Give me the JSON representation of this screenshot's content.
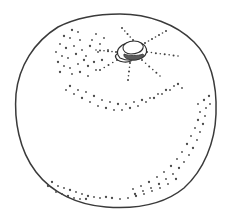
{
  "illustration": {
    "title": "Citrus fruit line drawing",
    "subject": "orange",
    "style": "pen-and-ink stipple line art",
    "canvas": {
      "width": 236,
      "height": 220
    },
    "colors": {
      "background": "#ffffff",
      "outline": "#3a3a3a",
      "stipple": "#4a4a4a",
      "calyx_outline": "#2e2e2e",
      "calyx_shade": "#5a5a5a"
    },
    "body": {
      "label": "fruit body contour",
      "shape": "irregular circle, slightly flattened at top",
      "bounds": {
        "left": 14,
        "top": 14,
        "right": 217,
        "bottom": 208
      },
      "path": "M 120 14 C 148 14 176 24 194 42 C 212 60 217 88 216 114 C 215 142 204 170 184 188 C 162 206 132 209 106 207 C 78 205 52 193 36 172 C 19 150 14 120 16 94 C 19 66 34 42 58 27 C 76 18 99 14 120 14 Z"
    },
    "calyx": {
      "label": "stem scar and calyx",
      "center": {
        "x": 130,
        "y": 52
      },
      "outer_path": "M 118 55 C 116 50 120 45 127 43 C 134 41 142 42 145 46 C 148 50 147 55 142 58 C 136 61 126 61 120 58 Z",
      "inner_path": "M 123 48 C 123 44 128 41 134 41 C 140 41 144 44 143 48 C 142 52 136 54 131 54 C 126 54 123 51 123 48 Z",
      "shade_path": "M 124 54 C 129 56 138 56 143 54 C 145 56 142 59 135 60 C 128 60 123 58 124 54 Z",
      "lower_lobe_path": "M 116 58 C 114 55 118 52 124 52 C 128 55 132 58 131 61 C 126 63 118 62 116 58 Z"
    },
    "rays": {
      "label": "radiating dotted rays from calyx",
      "count": 7,
      "lines": [
        {
          "name": "ray-north",
          "x1": 133,
          "y1": 40,
          "x2": 122,
          "y2": 28,
          "dots": 5
        },
        {
          "name": "ray-northeast",
          "x1": 145,
          "y1": 43,
          "x2": 166,
          "y2": 31,
          "dots": 7
        },
        {
          "name": "ray-east",
          "x1": 147,
          "y1": 52,
          "x2": 178,
          "y2": 56,
          "dots": 8
        },
        {
          "name": "ray-southeast",
          "x1": 142,
          "y1": 60,
          "x2": 160,
          "y2": 76,
          "dots": 6
        },
        {
          "name": "ray-south",
          "x1": 130,
          "y1": 63,
          "x2": 128,
          "y2": 80,
          "dots": 5
        },
        {
          "name": "ray-southwest",
          "x1": 117,
          "y1": 60,
          "x2": 100,
          "y2": 70,
          "dots": 5
        },
        {
          "name": "ray-west",
          "x1": 116,
          "y1": 52,
          "x2": 96,
          "y2": 50,
          "dots": 6
        }
      ]
    },
    "stipple_groups": [
      {
        "name": "upper-left-arc",
        "description": "loose arc of dots sweeping down from the top-left shoulder",
        "dot_count": 34,
        "dots": [
          [
            72,
            30
          ],
          [
            78,
            32
          ],
          [
            70,
            38
          ],
          [
            64,
            36
          ],
          [
            80,
            40
          ],
          [
            74,
            46
          ],
          [
            66,
            48
          ],
          [
            60,
            44
          ],
          [
            82,
            50
          ],
          [
            76,
            54
          ],
          [
            68,
            58
          ],
          [
            62,
            56
          ],
          [
            84,
            60
          ],
          [
            78,
            64
          ],
          [
            70,
            68
          ],
          [
            88,
            66
          ],
          [
            92,
            40
          ],
          [
            96,
            34
          ],
          [
            90,
            46
          ],
          [
            98,
            52
          ],
          [
            86,
            56
          ],
          [
            94,
            62
          ],
          [
            100,
            44
          ],
          [
            104,
            38
          ],
          [
            58,
            62
          ],
          [
            64,
            66
          ],
          [
            72,
            74
          ],
          [
            80,
            72
          ],
          [
            88,
            76
          ],
          [
            96,
            70
          ],
          [
            102,
            60
          ],
          [
            108,
            50
          ],
          [
            56,
            52
          ],
          [
            60,
            72
          ]
        ]
      },
      {
        "name": "mid-sweep-band",
        "description": "band of dots curving across the middle of the fruit",
        "dot_count": 30,
        "dots": [
          [
            70,
            86
          ],
          [
            78,
            90
          ],
          [
            86,
            92
          ],
          [
            94,
            96
          ],
          [
            102,
            100
          ],
          [
            110,
            102
          ],
          [
            118,
            104
          ],
          [
            126,
            104
          ],
          [
            134,
            102
          ],
          [
            142,
            100
          ],
          [
            150,
            98
          ],
          [
            158,
            94
          ],
          [
            166,
            90
          ],
          [
            174,
            86
          ],
          [
            74,
            94
          ],
          [
            82,
            98
          ],
          [
            90,
            102
          ],
          [
            98,
            106
          ],
          [
            106,
            108
          ],
          [
            114,
            110
          ],
          [
            122,
            110
          ],
          [
            130,
            108
          ],
          [
            138,
            106
          ],
          [
            146,
            102
          ],
          [
            154,
            98
          ],
          [
            162,
            94
          ],
          [
            170,
            90
          ],
          [
            178,
            84
          ],
          [
            66,
            90
          ],
          [
            182,
            88
          ]
        ]
      },
      {
        "name": "right-rim-band",
        "description": "dense dotted band hugging the inside of the lower-right contour",
        "dot_count": 32,
        "dots": [
          [
            204,
            100
          ],
          [
            206,
            108
          ],
          [
            205,
            116
          ],
          [
            203,
            124
          ],
          [
            200,
            132
          ],
          [
            197,
            140
          ],
          [
            193,
            148
          ],
          [
            189,
            155
          ],
          [
            184,
            162
          ],
          [
            179,
            168
          ],
          [
            173,
            174
          ],
          [
            166,
            179
          ],
          [
            159,
            184
          ],
          [
            151,
            188
          ],
          [
            143,
            191
          ],
          [
            135,
            194
          ],
          [
            198,
            104
          ],
          [
            200,
            112
          ],
          [
            198,
            120
          ],
          [
            195,
            128
          ],
          [
            191,
            136
          ],
          [
            187,
            144
          ],
          [
            182,
            152
          ],
          [
            177,
            159
          ],
          [
            171,
            166
          ],
          [
            164,
            172
          ],
          [
            157,
            177
          ],
          [
            149,
            182
          ],
          [
            141,
            186
          ],
          [
            133,
            189
          ],
          [
            209,
            96
          ],
          [
            210,
            104
          ]
        ]
      },
      {
        "name": "bottom-left-cluster",
        "description": "small cluster of dots near the bottom-left rim",
        "dot_count": 16,
        "dots": [
          [
            52,
            182
          ],
          [
            58,
            186
          ],
          [
            64,
            188
          ],
          [
            70,
            190
          ],
          [
            76,
            192
          ],
          [
            82,
            194
          ],
          [
            88,
            196
          ],
          [
            56,
            192
          ],
          [
            62,
            194
          ],
          [
            68,
            196
          ],
          [
            74,
            198
          ],
          [
            80,
            199
          ],
          [
            48,
            186
          ],
          [
            94,
            197
          ],
          [
            100,
            198
          ],
          [
            86,
            199
          ]
        ]
      },
      {
        "name": "bottom-center-scatter",
        "description": "sparse scatter along the bottom edge",
        "dot_count": 10,
        "dots": [
          [
            112,
            198
          ],
          [
            120,
            199
          ],
          [
            128,
            198
          ],
          [
            136,
            196
          ],
          [
            144,
            194
          ],
          [
            152,
            191
          ],
          [
            106,
            197
          ],
          [
            160,
            188
          ],
          [
            168,
            184
          ],
          [
            176,
            179
          ]
        ]
      }
    ]
  }
}
